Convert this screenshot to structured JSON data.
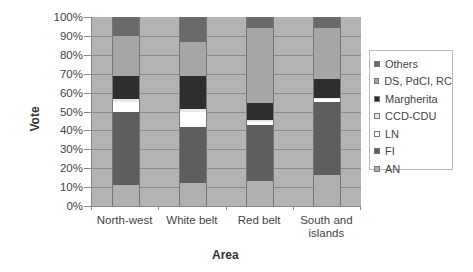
{
  "chart_data": {
    "type": "bar",
    "stacked": true,
    "normalized_percent": true,
    "title": "",
    "xlabel": "Area",
    "ylabel": "Vote",
    "ylim": [
      0,
      100
    ],
    "yticks": [
      "0%",
      "10%",
      "20%",
      "30%",
      "40%",
      "50%",
      "60%",
      "70%",
      "80%",
      "90%",
      "100%"
    ],
    "categories": [
      "North-west",
      "White belt",
      "Red belt",
      "South and islands"
    ],
    "series": [
      {
        "name": "AN",
        "color": "#b0b0b0",
        "values": [
          11,
          12,
          13,
          16.5
        ]
      },
      {
        "name": "FI",
        "color": "#5e5e5e",
        "values": [
          39,
          30,
          30,
          38.5
        ]
      },
      {
        "name": "LN",
        "color": "#ffffff",
        "values": [
          5,
          8,
          1.5,
          1.5
        ]
      },
      {
        "name": "CCD-CDU",
        "color": "#e8e8e8",
        "values": [
          1.5,
          1.5,
          1,
          0.5
        ]
      },
      {
        "name": "Margherita",
        "color": "#2e2e2e",
        "values": [
          12.5,
          17.5,
          9,
          10
        ]
      },
      {
        "name": "DS, PdCI, RC",
        "color": "#a6a6a6",
        "values": [
          21,
          18,
          39.5,
          27
        ]
      },
      {
        "name": "Others",
        "color": "#6a6a6a",
        "values": [
          10,
          13,
          6,
          6
        ]
      }
    ],
    "grid": true,
    "legend_position": "right",
    "legend_order": [
      "Others",
      "DS, PdCI, RC",
      "Margherita",
      "CCD-CDU",
      "LN",
      "FI",
      "AN"
    ]
  },
  "axis": {
    "x_title": "Area",
    "y_title": "Vote",
    "category_labels": [
      "North-west",
      "White belt",
      "Red belt",
      "South and",
      "islands"
    ]
  }
}
